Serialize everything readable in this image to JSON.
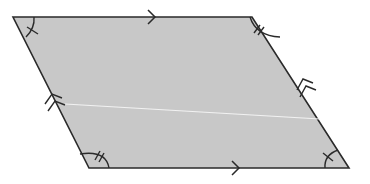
{
  "diagram": {
    "title": "Parallelogram with equal opposite angles and parallel sides",
    "shape": "parallelogram",
    "fill_color": "#c8c8c8",
    "stroke_color": "#2a2a2a",
    "background": "#ffffff",
    "vertices": {
      "top_left": [
        13,
        17
      ],
      "top_right": [
        252,
        17
      ],
      "bottom_right": [
        349,
        168
      ],
      "bottom_left": [
        89,
        168
      ]
    },
    "parallel_markers": {
      "top_side": "single-arrow",
      "bottom_side": "single-arrow",
      "left_side": "double-arrow",
      "right_side": "double-arrow"
    },
    "angle_markers": {
      "top_left": "single-tick",
      "bottom_right": "single-tick",
      "top_right": "double-tick",
      "bottom_left": "double-tick"
    },
    "diagonal_line": {
      "from": [
        65,
        104
      ],
      "to": [
        320,
        119
      ],
      "color": "#f2f2f2"
    }
  }
}
